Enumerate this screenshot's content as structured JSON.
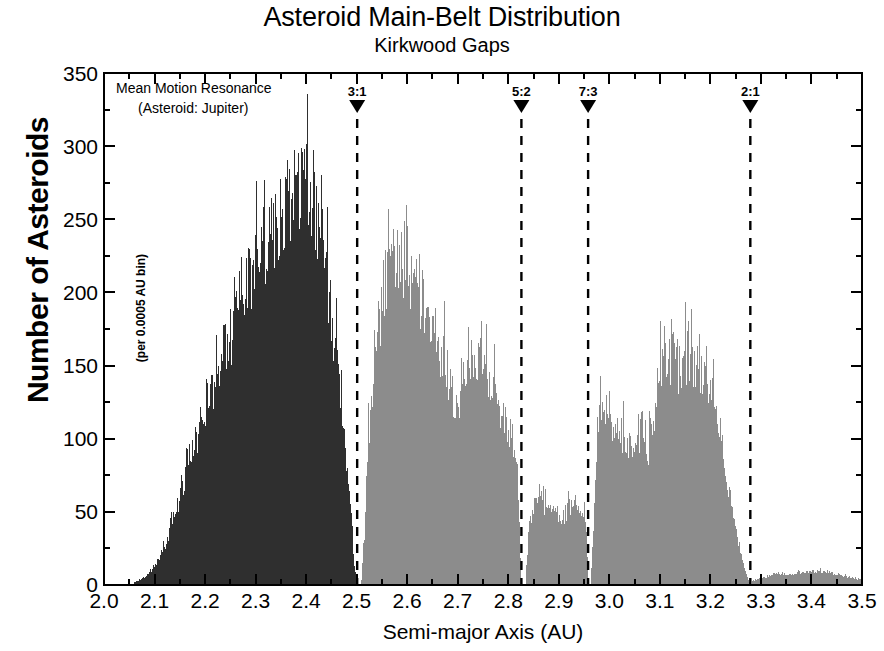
{
  "chart_data": {
    "type": "bar",
    "title": "Asteroid Main-Belt Distribution",
    "subtitle": "Kirkwood Gaps",
    "xlabel": "Semi-major Axis (AU)",
    "ylabel": "Number of Asteroids",
    "ylabel_sub": "(per 0.0005 AU bin)",
    "xlim": [
      2.0,
      3.5
    ],
    "ylim": [
      0,
      350
    ],
    "x_major_step": 0.1,
    "x_minor_step": 0.05,
    "y_major_step": 50,
    "y_minor_step": 25,
    "grid": false,
    "legend": null,
    "bin_width": 0.0005,
    "xticks": [
      "2.0",
      "2.1",
      "2.2",
      "2.3",
      "2.4",
      "2.5",
      "2.6",
      "2.7",
      "2.8",
      "2.9",
      "3.0",
      "3.1",
      "3.2",
      "3.3",
      "3.4",
      "3.5"
    ],
    "yticks": [
      "0",
      "50",
      "100",
      "150",
      "200",
      "250",
      "300",
      "350"
    ],
    "annotations": [
      {
        "name": "mean-motion-resonance-note",
        "line1": "Mean Motion Resonance",
        "line2": "(Asteroid: Jupiter)",
        "x": 2.025,
        "y": 335
      }
    ],
    "resonance_markers": [
      {
        "label": "3:1",
        "x": 2.501
      },
      {
        "label": "5:2",
        "x": 2.826
      },
      {
        "label": "7:3",
        "x": 2.958
      },
      {
        "label": "2:1",
        "x": 3.279
      }
    ],
    "colors": {
      "inner_belt": "#2f2f2f",
      "middle_belt": "#8c8c8c",
      "axis": "#000000",
      "background": "#ffffff"
    },
    "series": [
      {
        "name": "Inner belt (2.06 - 2.50 AU)",
        "color": "#2f2f2f",
        "x_start": 2.06,
        "x_end": 2.502,
        "envelope_x": [
          2.06,
          2.08,
          2.1,
          2.12,
          2.14,
          2.16,
          2.18,
          2.2,
          2.22,
          2.24,
          2.26,
          2.28,
          2.3,
          2.32,
          2.34,
          2.36,
          2.38,
          2.39,
          2.4,
          2.42,
          2.44,
          2.46,
          2.47,
          2.48,
          2.49,
          2.495,
          2.5
        ],
        "envelope_y": [
          2,
          6,
          14,
          30,
          52,
          80,
          105,
          128,
          150,
          172,
          196,
          218,
          240,
          258,
          272,
          288,
          300,
          305,
          296,
          272,
          230,
          170,
          130,
          85,
          40,
          14,
          0
        ]
      },
      {
        "name": "Middle belt (2.50 - 2.825 AU)",
        "color": "#8c8c8c",
        "x_start": 2.508,
        "x_end": 2.826,
        "envelope_x": [
          2.508,
          2.515,
          2.52,
          2.53,
          2.545,
          2.555,
          2.565,
          2.575,
          2.585,
          2.595,
          2.605,
          2.615,
          2.625,
          2.635,
          2.645,
          2.655,
          2.665,
          2.675,
          2.685,
          2.695,
          2.705,
          2.715,
          2.725,
          2.735,
          2.745,
          2.755,
          2.765,
          2.775,
          2.785,
          2.795,
          2.805,
          2.815,
          2.82,
          2.825
        ],
        "envelope_y": [
          0,
          40,
          95,
          150,
          200,
          228,
          244,
          250,
          238,
          246,
          228,
          222,
          214,
          208,
          196,
          186,
          176,
          166,
          150,
          126,
          140,
          170,
          176,
          172,
          168,
          160,
          150,
          140,
          130,
          120,
          112,
          100,
          60,
          0
        ]
      },
      {
        "name": "Gap band (2.83 - 2.958 AU)",
        "color": "#8c8c8c",
        "x_start": 2.833,
        "x_end": 2.958,
        "envelope_x": [
          2.833,
          2.84,
          2.85,
          2.86,
          2.87,
          2.88,
          2.89,
          2.9,
          2.91,
          2.92,
          2.93,
          2.94,
          2.95,
          2.955,
          2.958
        ],
        "envelope_y": [
          0,
          42,
          62,
          70,
          60,
          56,
          52,
          50,
          52,
          58,
          62,
          60,
          56,
          30,
          0
        ]
      },
      {
        "name": "Outer belt (2.962 - 3.279 AU)",
        "color": "#8c8c8c",
        "x_start": 2.962,
        "x_end": 3.279,
        "envelope_x": [
          2.962,
          2.97,
          2.975,
          2.985,
          2.995,
          3.005,
          3.015,
          3.025,
          3.035,
          3.045,
          3.055,
          3.065,
          3.075,
          3.085,
          3.095,
          3.105,
          3.115,
          3.125,
          3.135,
          3.145,
          3.155,
          3.165,
          3.175,
          3.185,
          3.195,
          3.205,
          3.215,
          3.225,
          3.235,
          3.245,
          3.255,
          3.265,
          3.272,
          3.279
        ],
        "envelope_y": [
          0,
          60,
          118,
          132,
          120,
          112,
          116,
          112,
          108,
          106,
          112,
          104,
          96,
          120,
          150,
          162,
          170,
          166,
          160,
          166,
          172,
          168,
          160,
          150,
          152,
          138,
          118,
          96,
          74,
          52,
          32,
          16,
          6,
          0
        ]
      },
      {
        "name": "Outer tail (3.28 - 3.50 AU)",
        "color": "#8c8c8c",
        "x_start": 3.282,
        "x_end": 3.5,
        "envelope_x": [
          3.282,
          3.3,
          3.32,
          3.34,
          3.36,
          3.38,
          3.4,
          3.42,
          3.44,
          3.46,
          3.48,
          3.5
        ],
        "envelope_y": [
          3,
          5,
          7,
          8,
          8,
          9,
          10,
          10,
          9,
          7,
          5,
          4
        ]
      }
    ]
  }
}
